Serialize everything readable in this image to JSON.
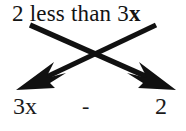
{
  "diagram": {
    "title_phrase": {
      "full_text": "2 less than 3x",
      "lead_number": "2",
      "words": " less than ",
      "coefficient": "3",
      "variable": "x"
    },
    "expression": {
      "left_term": "3x",
      "operator": "-",
      "right_term": "2"
    },
    "arrows": [
      {
        "name": "arrow-number-to-right-term",
        "from_label": "2",
        "to_label": "2",
        "direction": "down-right",
        "color": "#111111"
      },
      {
        "name": "arrow-variable-to-left-term",
        "from_label": "3x",
        "to_label": "3x",
        "direction": "down-left",
        "color": "#111111"
      }
    ],
    "colors": {
      "background": "#ffffff",
      "ink": "#121212",
      "arrow": "#111111"
    }
  }
}
